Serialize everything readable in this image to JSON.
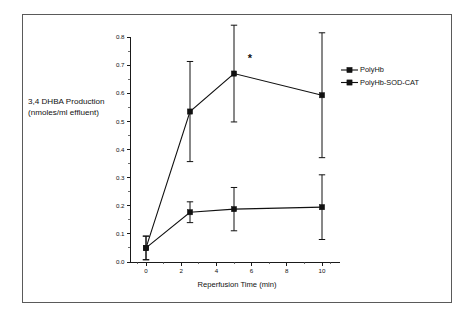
{
  "chart_data": {
    "type": "line",
    "title": "",
    "xlabel": "Reperfusion Time (min)",
    "ylabel_line1": "3,4 DHBA Production",
    "ylabel_line2": "(nmoles/ml effluent)",
    "xlim": [
      -1.0,
      11.0
    ],
    "ylim": [
      0.0,
      0.8
    ],
    "xticks": [
      0,
      2,
      4,
      6,
      8,
      10
    ],
    "xtick_labels": [
      "0",
      "2",
      "4",
      "6",
      "8",
      "10"
    ],
    "yticks": [
      0.0,
      0.1,
      0.2,
      0.3,
      0.4,
      0.5,
      0.6,
      0.7,
      0.8
    ],
    "ytick_labels": [
      "0.0",
      "0.1",
      "0.2",
      "0.3",
      "0.4",
      "0.5",
      "0.6",
      "0.7",
      "0.8"
    ],
    "grid": false,
    "legend_position": "right",
    "x": [
      0,
      2.5,
      5,
      10
    ],
    "series": [
      {
        "name": "PolyHb",
        "marker": "filled-square",
        "values": [
          0.05,
          0.535,
          0.67,
          0.593
        ],
        "errors": [
          0.042,
          0.178,
          0.172,
          0.222
        ]
      },
      {
        "name": "PolyHb-SOD-CAT",
        "marker": "filled-square",
        "values": [
          0.05,
          0.177,
          0.188,
          0.195
        ],
        "errors": [
          0.042,
          0.037,
          0.077,
          0.115
        ]
      }
    ],
    "annotations": [
      {
        "text": "*",
        "x": 5.9,
        "y": 0.725
      }
    ]
  },
  "legend": {
    "entries": [
      {
        "label": "PolyHb"
      },
      {
        "label": "PolyHb-SOD-CAT"
      }
    ]
  },
  "colors": {
    "ink": "#111111",
    "frame": "#5a5a5a",
    "background": "#ffffff"
  }
}
